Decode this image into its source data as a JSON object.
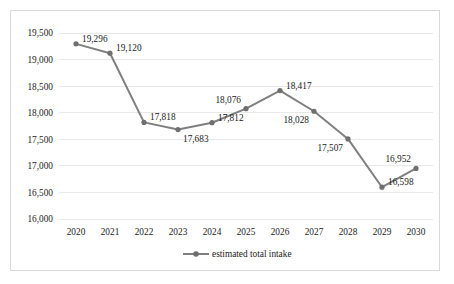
{
  "chart_data": {
    "type": "line",
    "title": "",
    "subtitle": "",
    "xlabel": "",
    "ylabel": "",
    "categories": [
      "2020",
      "2021",
      "2022",
      "2023",
      "2024",
      "2025",
      "2026",
      "2027",
      "2028",
      "2029",
      "2030"
    ],
    "series": [
      {
        "name": "estimated total intake",
        "values": [
          19296,
          19120,
          17818,
          17683,
          17812,
          18076,
          18417,
          18028,
          17507,
          16598,
          16952
        ],
        "color": "#7f7f7f",
        "marker": "circle"
      }
    ],
    "point_labels": [
      "19,296",
      "19,120",
      "17,818",
      "17,683",
      "17,812",
      "18,076",
      "18,417",
      "18,028",
      "17,507",
      "16,598",
      "16,952"
    ],
    "label_placement": [
      "right",
      "right",
      "right",
      "below-right",
      "right",
      "above-left",
      "right",
      "below-left",
      "below-left",
      "right",
      "above-left"
    ],
    "ylim": [
      16000,
      19500
    ],
    "ytick_values": [
      16000,
      16500,
      17000,
      17500,
      18000,
      18500,
      19000,
      19500
    ],
    "ytick_labels": [
      "16,000",
      "16,500",
      "17,000",
      "17,500",
      "18,000",
      "18,500",
      "19,000",
      "19,500"
    ],
    "grid": true,
    "grid_axis": "y",
    "legend": {
      "position": "bottom",
      "entries": [
        {
          "label": "estimated total intake",
          "color": "#7f7f7f",
          "marker": "circle"
        }
      ]
    },
    "border": true,
    "background_color": "#ffffff",
    "border_color": "#d9d9d9",
    "gridline_color": "#e8e8e8",
    "text_color": "#1a1a1a"
  }
}
